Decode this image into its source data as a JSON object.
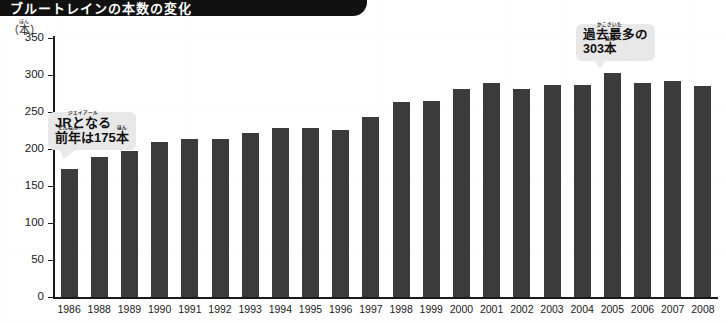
{
  "banner": {
    "title": "ブルートレインの本数の変化"
  },
  "axis": {
    "unit_furigana": "ほん",
    "unit_label": "（本）"
  },
  "callouts": {
    "left": {
      "line1": "JRとなる",
      "line2_ruby_kanji": "前年",
      "line2_ruby_reading": "ぜんねん",
      "line2_rest": "は175",
      "line2_unit": "本",
      "line2_unit_reading": "ほん",
      "line1_furigana": "ジェイアール"
    },
    "right": {
      "line1_kanji": "過去最多",
      "line1_reading": "かこさいた",
      "line1_rest": "の",
      "line2_number": "303",
      "line2_unit": "本",
      "line2_unit_reading": "ほん"
    }
  },
  "chart_data": {
    "type": "bar",
    "title": "ブルートレインの本数の変化",
    "xlabel": "",
    "ylabel": "（本）",
    "ylim": [
      0,
      350
    ],
    "ytick_step": 50,
    "yticks": [
      0,
      50,
      100,
      150,
      200,
      250,
      300,
      350
    ],
    "grid": false,
    "legend": "none",
    "bar_color": "#3b3b3b",
    "categories": [
      "1986",
      "1988",
      "1989",
      "1990",
      "1991",
      "1992",
      "1993",
      "1994",
      "1995",
      "1996",
      "1997",
      "1998",
      "1999",
      "2000",
      "2001",
      "2002",
      "2003",
      "2004",
      "2005",
      "2006",
      "2007",
      "2008"
    ],
    "values": [
      173,
      189,
      197,
      210,
      214,
      214,
      222,
      228,
      229,
      226,
      243,
      263,
      265,
      281,
      289,
      281,
      286,
      286,
      303,
      289,
      292,
      285
    ],
    "annotations": [
      {
        "label": "JRとなる前年は175本",
        "category": "1986",
        "value": 175
      },
      {
        "label": "過去最多の303本",
        "category": "2005",
        "value": 303
      }
    ]
  }
}
